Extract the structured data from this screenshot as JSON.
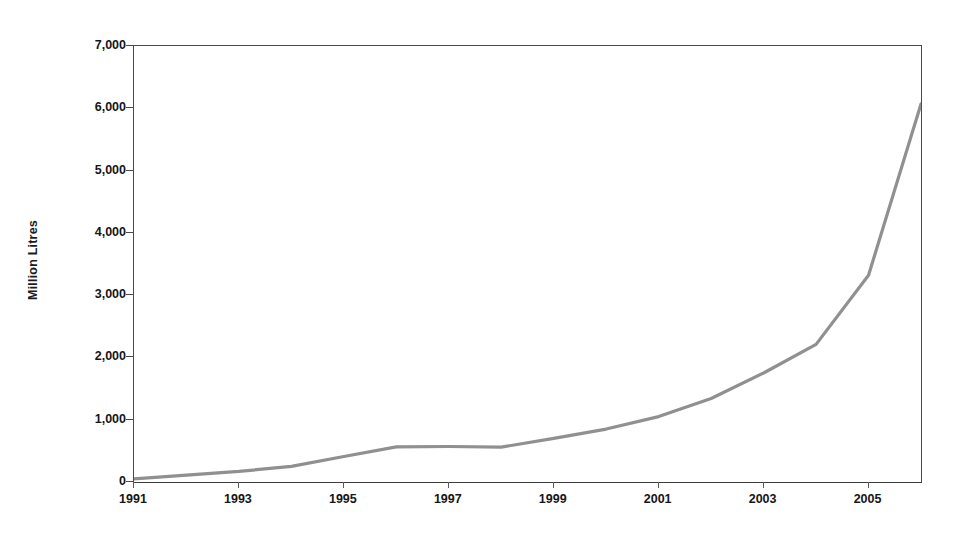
{
  "chart_data": {
    "type": "line",
    "title": "",
    "subtitle": "",
    "xlabel": "",
    "ylabel": "Million Litres",
    "x": [
      1991,
      1992,
      1993,
      1994,
      1995,
      1996,
      1997,
      1998,
      1999,
      2000,
      2001,
      2002,
      2003,
      2004,
      2005,
      2006
    ],
    "series": [
      {
        "name": "Production",
        "values": [
          50,
          110,
          170,
          250,
          410,
          565,
          570,
          560,
          700,
          850,
          1050,
          1340,
          1750,
          2210,
          3320,
          6070
        ]
      }
    ],
    "xlim": [
      1991,
      2006
    ],
    "ylim": [
      0,
      7000
    ],
    "xticks": [
      1991,
      1993,
      1995,
      1997,
      1999,
      2001,
      2003,
      2005
    ],
    "xtick_labels": [
      "1991",
      "1993",
      "1995",
      "1997",
      "1999",
      "2001",
      "2003",
      "2005"
    ],
    "yticks": [
      0,
      1000,
      2000,
      3000,
      4000,
      5000,
      6000,
      7000
    ],
    "ytick_labels": [
      "0",
      "1,000",
      "2,000",
      "3,000",
      "4,000",
      "5,000",
      "6,000",
      "7,000"
    ],
    "grid": false,
    "legend": false,
    "legend_position": "none",
    "colors": {
      "line": "#909090",
      "axis": "#4a4a4a",
      "text": "#161616",
      "background": "#ffffff"
    },
    "line_width": 3.2
  }
}
